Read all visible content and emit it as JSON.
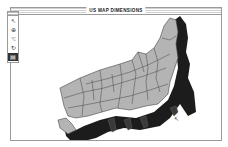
{
  "window": {
    "title": "US MAP DIMENSIONS"
  },
  "palette": {
    "tools": [
      {
        "name": "arrow-tool",
        "glyph": "↖"
      },
      {
        "name": "zoom-tool",
        "glyph": "⊕"
      },
      {
        "name": "hand-tool",
        "glyph": "☜"
      },
      {
        "name": "rotate-tool",
        "glyph": "↻"
      },
      {
        "name": "extrude-tool",
        "glyph": "▤",
        "selected": true
      }
    ]
  },
  "map": {
    "description": "3D extruded map of the contiguous United States with state borders",
    "fill_color": "#b4b4b4",
    "border_color": "#444444",
    "extrusion_color": "#1a1a1a"
  },
  "cursor": {
    "glyph": "↖"
  }
}
